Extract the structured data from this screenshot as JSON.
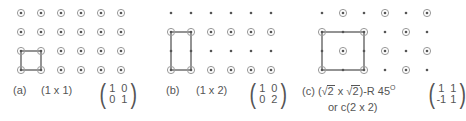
{
  "colors": {
    "ink": "#555555",
    "line": "#666666",
    "ring": "#999999",
    "background": "#ffffff"
  },
  "panels": [
    {
      "id": "a",
      "label": "(a)",
      "notation": "(1 x 1)",
      "matrix": {
        "r1c1": "1",
        "r1c2": "0",
        "r2c1": "0",
        "r2c2": "1"
      }
    },
    {
      "id": "b",
      "label": "(b)",
      "notation": "(1 x 2)",
      "matrix": {
        "r1c1": "1",
        "r1c2": "0",
        "r2c1": "0",
        "r2c2": "2"
      }
    },
    {
      "id": "c",
      "label": "(c)",
      "notation_prefix": "(",
      "sqrt_sign": "√",
      "sqrt_arg": "2",
      "times": "x",
      "notation_suffix": ")-R 45",
      "degree": "O",
      "alt_notation": "or c(2 x 2)",
      "matrix": {
        "r1c1": "1",
        "r1c2": "1",
        "r2c1": "-1",
        "r2c2": "1"
      }
    }
  ],
  "lattice": {
    "rows": 4,
    "cols": 6,
    "description": "Substrate atoms (dots) with adsorbate sites (ringed dots); unit cell outlined"
  }
}
